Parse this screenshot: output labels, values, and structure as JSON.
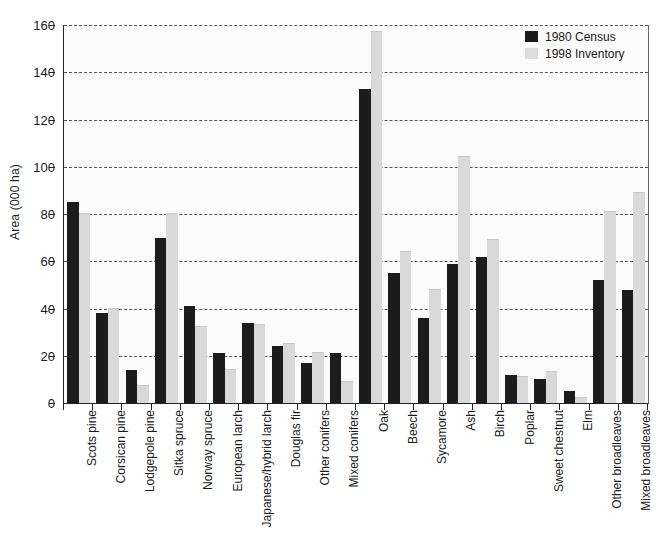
{
  "chart_data": {
    "type": "bar",
    "title": "",
    "xlabel": "",
    "ylabel": "Area (000 ha)",
    "ylim": [
      0,
      160
    ],
    "ytick_values": [
      0,
      20,
      40,
      60,
      80,
      100,
      120,
      140,
      160
    ],
    "ytick_labels": [
      "0",
      "20",
      "40",
      "60",
      "80",
      "100",
      "120",
      "140",
      "160"
    ],
    "grid": "horizontal-dashed",
    "legend_position": "top-right",
    "categories": [
      "Scots pine",
      "Corsican pine",
      "Lodgepole pine",
      "Sitka spruce",
      "Norway spruce",
      "European larch",
      "Japanese/hybrid larch",
      "Douglas fir",
      "Other conifers",
      "Mixed conifers",
      "Oak",
      "Beech",
      "Sycamore",
      "Ash",
      "Birch",
      "Poplar",
      "Sweet chestnut",
      "Elm",
      "Other broadleaves",
      "Mixed broadleaves"
    ],
    "series": [
      {
        "name": "1980 Census",
        "color": "#1c1c1c",
        "values": [
          85,
          38,
          14,
          70,
          41,
          21,
          34,
          24,
          17,
          21,
          133,
          55,
          36,
          59,
          62,
          12,
          10,
          5,
          52,
          48
        ]
      },
      {
        "name": "1998 Inventory",
        "color": "#d9d9d9",
        "values": [
          80,
          40,
          7,
          80,
          32,
          14,
          33,
          25,
          21,
          9,
          157,
          64,
          48,
          104,
          69,
          11,
          13,
          2,
          81,
          89
        ]
      }
    ]
  },
  "legend": {
    "items": [
      {
        "label": "1980 Census",
        "swatch": "census"
      },
      {
        "label": "1998 Inventory",
        "swatch": "inventory"
      }
    ]
  }
}
